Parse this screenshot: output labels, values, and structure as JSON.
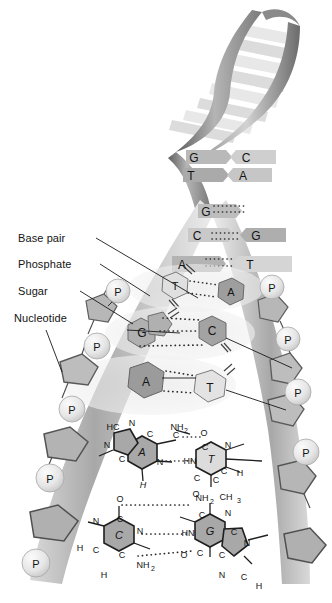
{
  "diagram": {
    "colors": {
      "ink": "#141414",
      "backbone_dark": "#6e6e6e",
      "backbone_mid": "#9a9a9a",
      "backbone_light": "#c9c9c9",
      "base_dark": "#8f8f8f",
      "base_light": "#d8d8d8",
      "phosphate": "#e2e2e2",
      "highlight": "#e6e6e6",
      "background": "#ffffff"
    }
  },
  "labels": [
    {
      "id": "base-pair",
      "text": "Base pair"
    },
    {
      "id": "phosphate",
      "text": "Phosphate"
    },
    {
      "id": "sugar",
      "text": "Sugar"
    },
    {
      "id": "nucleotide",
      "text": "Nucleotide"
    }
  ],
  "helix_bases": [
    {
      "id": "hx1-left",
      "text": "G"
    },
    {
      "id": "hx1-right",
      "text": "C"
    },
    {
      "id": "hx2-left",
      "text": "T"
    },
    {
      "id": "hx2-right",
      "text": "A"
    },
    {
      "id": "hx3-left",
      "text": "G"
    },
    {
      "id": "hx4-left",
      "text": "C"
    },
    {
      "id": "hx4-right",
      "text": "G"
    },
    {
      "id": "hx5-left",
      "text": "A"
    },
    {
      "id": "hx5-right",
      "text": "T"
    }
  ],
  "ladder_bases": [
    {
      "id": "lad1-left",
      "text": "T"
    },
    {
      "id": "lad1-right",
      "text": "A"
    },
    {
      "id": "lad2-left",
      "text": "G"
    },
    {
      "id": "lad2-right",
      "text": "C"
    },
    {
      "id": "lad3-left",
      "text": "A"
    },
    {
      "id": "lad3-right",
      "text": "T"
    }
  ],
  "phosphates": [
    {
      "id": "p-l1",
      "text": "P"
    },
    {
      "id": "p-l2",
      "text": "P"
    },
    {
      "id": "p-l3",
      "text": "P"
    },
    {
      "id": "p-l4",
      "text": "P"
    },
    {
      "id": "p-l5",
      "text": "P"
    },
    {
      "id": "p-r1",
      "text": "P"
    },
    {
      "id": "p-r2",
      "text": "P"
    },
    {
      "id": "p-r3",
      "text": "P"
    },
    {
      "id": "p-r4",
      "text": "P"
    }
  ],
  "molecule_at": {
    "base_left": "A",
    "base_right": "T",
    "atoms": [
      {
        "id": "a-hc",
        "text": "HC"
      },
      {
        "id": "a-n1",
        "text": "N"
      },
      {
        "id": "a-c1",
        "text": "C"
      },
      {
        "id": "a-n2",
        "text": "N"
      },
      {
        "id": "a-c2",
        "text": "C"
      },
      {
        "id": "a-c3",
        "text": "C"
      },
      {
        "id": "a-n3",
        "text": "N"
      },
      {
        "id": "a-c4",
        "text": "C"
      },
      {
        "id": "a-n4",
        "text": "N"
      },
      {
        "id": "a-h",
        "text": "H"
      },
      {
        "id": "a-nh2",
        "text": "NH"
      },
      {
        "id": "a-nh2s",
        "text": "2"
      },
      {
        "id": "t-o1",
        "text": "O"
      },
      {
        "id": "t-c1",
        "text": "C"
      },
      {
        "id": "t-n1",
        "text": "N"
      },
      {
        "id": "t-hn",
        "text": "HN"
      },
      {
        "id": "t-c2",
        "text": "C"
      },
      {
        "id": "t-ch",
        "text": "C"
      },
      {
        "id": "t-h",
        "text": "H"
      },
      {
        "id": "t-c3",
        "text": "C"
      },
      {
        "id": "t-o2",
        "text": "O"
      },
      {
        "id": "t-ch3",
        "text": "CH"
      },
      {
        "id": "t-ch3s",
        "text": "3"
      }
    ]
  },
  "molecule_cg": {
    "base_left": "C",
    "base_right": "G",
    "atoms": [
      {
        "id": "c-o1",
        "text": "O"
      },
      {
        "id": "c-c1",
        "text": "C"
      },
      {
        "id": "c-n1",
        "text": "N"
      },
      {
        "id": "c-n2",
        "text": "N"
      },
      {
        "id": "c-c2",
        "text": "C"
      },
      {
        "id": "c-c3",
        "text": "C"
      },
      {
        "id": "c-h1",
        "text": "H"
      },
      {
        "id": "c-h2",
        "text": "H"
      },
      {
        "id": "c-nh2",
        "text": "NH"
      },
      {
        "id": "c-nh2s",
        "text": "2"
      },
      {
        "id": "g-nh2",
        "text": "NH"
      },
      {
        "id": "g-nh2s",
        "text": "2"
      },
      {
        "id": "g-c1",
        "text": "C"
      },
      {
        "id": "g-n1",
        "text": "N"
      },
      {
        "id": "g-hn",
        "text": "HN"
      },
      {
        "id": "g-c2",
        "text": "C"
      },
      {
        "id": "g-c3",
        "text": "C"
      },
      {
        "id": "g-c4",
        "text": "C"
      },
      {
        "id": "g-o1",
        "text": "O"
      },
      {
        "id": "g-n2",
        "text": "N"
      },
      {
        "id": "g-n3",
        "text": "N"
      },
      {
        "id": "g-ch",
        "text": "C"
      },
      {
        "id": "g-h",
        "text": "H"
      }
    ]
  }
}
